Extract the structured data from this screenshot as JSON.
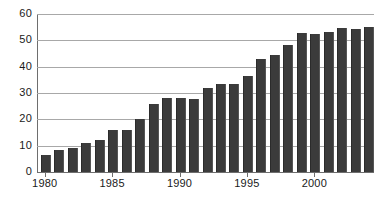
{
  "chart_data": {
    "type": "bar",
    "title": "",
    "subtitle": "",
    "xlabel": "",
    "ylabel": "",
    "ylim": [
      0,
      60
    ],
    "ytick_labels": [
      "60",
      "50",
      "40",
      "30",
      "20",
      "10",
      "0"
    ],
    "ytick_values": [
      60,
      50,
      40,
      30,
      20,
      10,
      0
    ],
    "grid": true,
    "legend": null,
    "categories": [
      "1980",
      "1981",
      "1982",
      "1983",
      "1984",
      "1985",
      "1986",
      "1987",
      "1988",
      "1989",
      "1990",
      "1991",
      "1992",
      "1993",
      "1994",
      "1995",
      "1996",
      "1997",
      "1998",
      "1999",
      "2000",
      "2001",
      "2002",
      "2003",
      "2004"
    ],
    "values": [
      6.3,
      8.2,
      9.1,
      11.1,
      12.0,
      16.0,
      16.0,
      20.0,
      26.0,
      28.1,
      28.1,
      27.8,
      31.8,
      33.5,
      33.6,
      36.6,
      42.8,
      44.6,
      48.3,
      52.6,
      52.4,
      53.3,
      54.6,
      54.2,
      55.2
    ],
    "xtick_labels": [
      "1980",
      "1985",
      "1990",
      "1995",
      "2000"
    ],
    "xtick_categories": [
      "1980",
      "1985",
      "1990",
      "1995",
      "2000"
    ],
    "bar_color": "#3b3b3b",
    "gridline_color": "#a8a8a8",
    "axis_color": "#6e6e6e",
    "background_color": "#ffffff"
  }
}
